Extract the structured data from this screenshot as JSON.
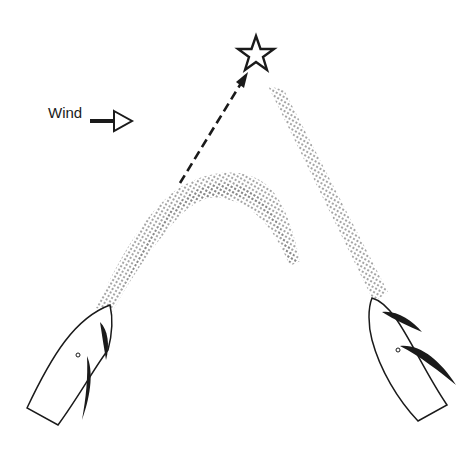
{
  "diagram": {
    "wind_label": "Wind",
    "colors": {
      "ink": "#1a1a1a",
      "wake_dots": "#7a7a7a",
      "background": "#ffffff"
    },
    "elements": {
      "mark": "star-icon",
      "course_line": "dashed-arrow",
      "left_boat": "sailboat-left",
      "right_boat": "sailboat-right",
      "left_wake": "curved-wake",
      "right_wake": "straight-wake"
    }
  }
}
